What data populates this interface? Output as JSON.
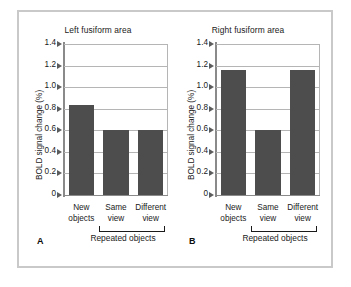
{
  "figure": {
    "bar_color": "#4d4d4d",
    "grid_color": "#b5b5b5",
    "axis_color": "#8a8a8a",
    "frame_color": "#c9c9c9",
    "background": "#ffffff"
  },
  "chart_data": [
    {
      "type": "bar",
      "panel": "A",
      "title": "Left fusiform area",
      "xlabel": "Repeated objects",
      "ylabel": "BOLD signal change (%)",
      "categories": [
        "New objects",
        "Same view",
        "Different view"
      ],
      "category_lines": [
        [
          "New",
          "objects"
        ],
        [
          "Same",
          "view"
        ],
        [
          "Different",
          "view"
        ]
      ],
      "values": [
        0.83,
        0.6,
        0.6
      ],
      "ylim": [
        0,
        1.4
      ],
      "yticks": [
        0,
        0.2,
        0.4,
        0.6,
        0.8,
        1.0,
        1.2,
        1.4
      ],
      "ytick_labels": [
        "0",
        "0.2",
        "0.4",
        "0.6",
        "0.8",
        "1.0",
        "1.2",
        "1.4"
      ],
      "grid": true,
      "legend": "none",
      "bracket": {
        "label": "Repeated objects",
        "spans": [
          "Same view",
          "Different view"
        ]
      }
    },
    {
      "type": "bar",
      "panel": "B",
      "title": "Right fusiform area",
      "xlabel": "Repeated objects",
      "ylabel": "BOLD signal change (%)",
      "categories": [
        "New objects",
        "Same view",
        "Different view"
      ],
      "category_lines": [
        [
          "New",
          "objects"
        ],
        [
          "Same",
          "view"
        ],
        [
          "Different",
          "view"
        ]
      ],
      "values": [
        1.16,
        0.6,
        1.16
      ],
      "ylim": [
        0,
        1.4
      ],
      "yticks": [
        0,
        0.2,
        0.4,
        0.6,
        0.8,
        1.0,
        1.2,
        1.4
      ],
      "ytick_labels": [
        "0",
        "0.2",
        "0.4",
        "0.6",
        "0.8",
        "1.0",
        "1.2",
        "1.4"
      ],
      "grid": true,
      "legend": "none",
      "bracket": {
        "label": "Repeated objects",
        "spans": [
          "Same view",
          "Different view"
        ]
      }
    }
  ]
}
